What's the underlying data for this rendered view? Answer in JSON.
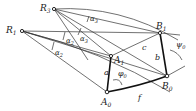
{
  "diagram": {
    "points": {
      "R3": {
        "label": "R",
        "sub": "3",
        "x": 54,
        "y": 9
      },
      "R1": {
        "label": "R",
        "sub": "1",
        "x": 22,
        "y": 31
      },
      "B1": {
        "label": "B",
        "sub": "1",
        "x": 160,
        "y": 33
      },
      "B0": {
        "label": "B",
        "sub": "0",
        "x": 167,
        "y": 76
      },
      "A0": {
        "label": "A",
        "sub": "0",
        "x": 107,
        "y": 92
      },
      "A1": {
        "label": "A",
        "sub": "1",
        "x": 111,
        "y": 56
      }
    },
    "links": {
      "a": "a",
      "b": "b",
      "c": "c",
      "f": "f"
    },
    "angles": {
      "alpha3_top": "α",
      "alpha3_top_sub": "3",
      "alpha3_mid": "α",
      "alpha3_mid_sub": "3",
      "alpha2_a": "α",
      "alpha2_a_sub": "2",
      "alpha2_b": "α",
      "alpha2_b_sub": "2",
      "phi0": "φ",
      "phi0_sub": "0",
      "psi0": "ψ",
      "psi0_sub": "0"
    }
  }
}
